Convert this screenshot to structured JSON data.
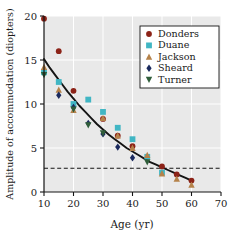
{
  "chart_data": {
    "type": "scatter",
    "title": "",
    "xlabel": "Age (yr)",
    "ylabel": "Amplitude of accommodation (diopters)",
    "xlim": [
      10,
      70
    ],
    "ylim": [
      0,
      20
    ],
    "xticks": [
      10,
      20,
      30,
      40,
      50,
      60,
      70
    ],
    "yticks": [
      0,
      5,
      10,
      15,
      20
    ],
    "grid": true,
    "grid_color": "#ffffff",
    "plot_bg": "#e9e9e9",
    "legend_position": "top-right",
    "series": [
      {
        "name": "Donders",
        "marker": "circle",
        "color": "#8c2318",
        "x": [
          10,
          15,
          20,
          30,
          35,
          40,
          50,
          55,
          60
        ],
        "y": [
          19.7,
          16.0,
          11.5,
          8.3,
          6.4,
          5.2,
          2.9,
          2.0,
          1.3
        ]
      },
      {
        "name": "Duane",
        "marker": "square",
        "color": "#41b6c4",
        "x": [
          10,
          15,
          20,
          25,
          30,
          35,
          40,
          45,
          50
        ],
        "y": [
          13.6,
          12.5,
          10.0,
          10.5,
          9.1,
          7.3,
          6.0,
          4.0,
          2.2
        ]
      },
      {
        "name": "Jackson",
        "marker": "triangle-up",
        "color": "#b5824a",
        "x": [
          10,
          15,
          20,
          30,
          35,
          40,
          45,
          50,
          55,
          60
        ],
        "y": [
          14.2,
          11.6,
          9.3,
          8.4,
          6.4,
          5.0,
          4.2,
          2.1,
          1.5,
          0.8
        ]
      },
      {
        "name": "Sheard",
        "marker": "diamond",
        "color": "#1b2a5e",
        "x": [
          15,
          20,
          25,
          30,
          35,
          40
        ],
        "y": [
          11.0,
          9.6,
          7.8,
          6.6,
          5.1,
          3.9
        ]
      },
      {
        "name": "Turner",
        "marker": "triangle-down",
        "color": "#2f5d3a",
        "x": [
          10,
          20,
          25,
          30,
          45
        ],
        "y": [
          13.3,
          9.4,
          7.6,
          6.7,
          3.4
        ]
      }
    ],
    "fit_curve": {
      "name": "fitted-decline-curve",
      "color": "#141414",
      "points": [
        [
          10,
          15.1
        ],
        [
          12,
          14.1
        ],
        [
          14,
          13.2
        ],
        [
          16,
          12.3
        ],
        [
          18,
          11.4
        ],
        [
          20,
          10.6
        ],
        [
          22,
          9.8
        ],
        [
          24,
          9.1
        ],
        [
          26,
          8.4
        ],
        [
          28,
          7.7
        ],
        [
          30,
          7.1
        ],
        [
          32,
          6.5
        ],
        [
          34,
          6.0
        ],
        [
          36,
          5.5
        ],
        [
          38,
          5.0
        ],
        [
          40,
          4.6
        ],
        [
          42,
          4.2
        ],
        [
          44,
          3.8
        ],
        [
          46,
          3.4
        ],
        [
          48,
          3.1
        ],
        [
          50,
          2.8
        ],
        [
          52,
          2.5
        ],
        [
          54,
          2.2
        ],
        [
          56,
          1.9
        ],
        [
          58,
          1.6
        ],
        [
          60,
          1.3
        ]
      ]
    },
    "reference_line": {
      "name": "threshold-dashed-line",
      "orientation": "horizontal",
      "value": 2.7,
      "style": "dashed",
      "color": "#141414"
    }
  },
  "legend": {
    "entries": [
      {
        "label": "Donders"
      },
      {
        "label": "Duane"
      },
      {
        "label": "Jackson"
      },
      {
        "label": "Sheard"
      },
      {
        "label": "Turner"
      }
    ]
  },
  "axes": {
    "x_tick_labels": [
      "10",
      "20",
      "30",
      "40",
      "50",
      "60",
      "70"
    ],
    "y_tick_labels": [
      "0",
      "5",
      "10",
      "15",
      "20"
    ],
    "x_title": "Age (yr)",
    "y_title": "Amplitude of accommodation (diopters)"
  }
}
